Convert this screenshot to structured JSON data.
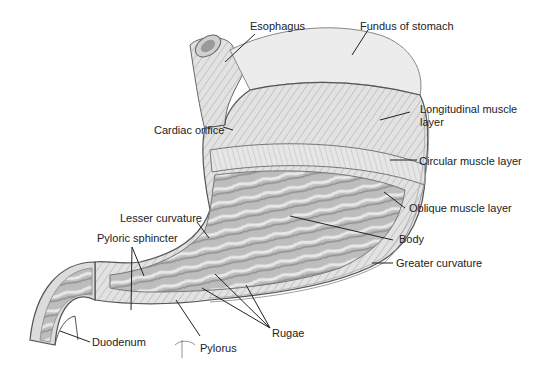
{
  "diagram": {
    "labels": {
      "esophagus": "Esophagus",
      "fundus": "Fundus of stomach",
      "longitudinal_line1": "Longitudinal muscle",
      "longitudinal_line2": "layer",
      "cardiac_orifice": "Cardiac orifice",
      "circular": "Circular muscle layer",
      "oblique": "Oblique muscle layer",
      "lesser_curvature": "Lesser curvature",
      "pyloric_sphincter": "Pyloric sphincter",
      "body": "Body",
      "greater_curvature": "Greater curvature",
      "duodenum": "Duodenum",
      "pylorus": "Pylorus",
      "rugae": "Rugae"
    },
    "colors": {
      "outline": "#555555",
      "muscle": "#d9d9d9",
      "muscle_dark": "#b5b5b5",
      "rugae": "#a8a8a8",
      "rugae_light": "#d0d0d0",
      "leader": "#222222",
      "text": "#222222"
    }
  }
}
